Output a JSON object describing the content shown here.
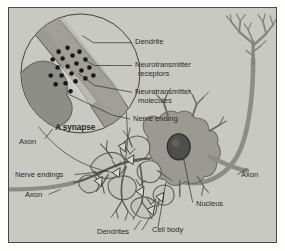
{
  "figure": {
    "background_color": "#c9c9c4",
    "border_color": "#4a4a46",
    "ink_color": "#2b2b28",
    "structure_fill": "#9a9a93",
    "structure_dark": "#7d7d78",
    "molecule_color": "#17171a"
  },
  "labels": {
    "dendrite": "Dendrite",
    "neurotransmitter_receptors_line1": "Neurotransmitter",
    "neurotransmitter_receptors_line2": "receptors",
    "neurotransmitter_molecules_line1": "Neurotransmitter",
    "neurotransmitter_molecules_line2": "molecules",
    "nerve_ending": "Nerve ending",
    "a_synapse": "A synapse",
    "axon_inset": "Axon",
    "nerve_endings": "Nerve endings",
    "axon_left": "Axon",
    "axon_right": "Axon",
    "nucleus": "Nucleus",
    "cell_body": "Cell body",
    "dendrites": "Dendrites"
  },
  "inset": {
    "name": "magnified-synapse-circle",
    "caption": "A synapse",
    "molecule_count": 21
  }
}
